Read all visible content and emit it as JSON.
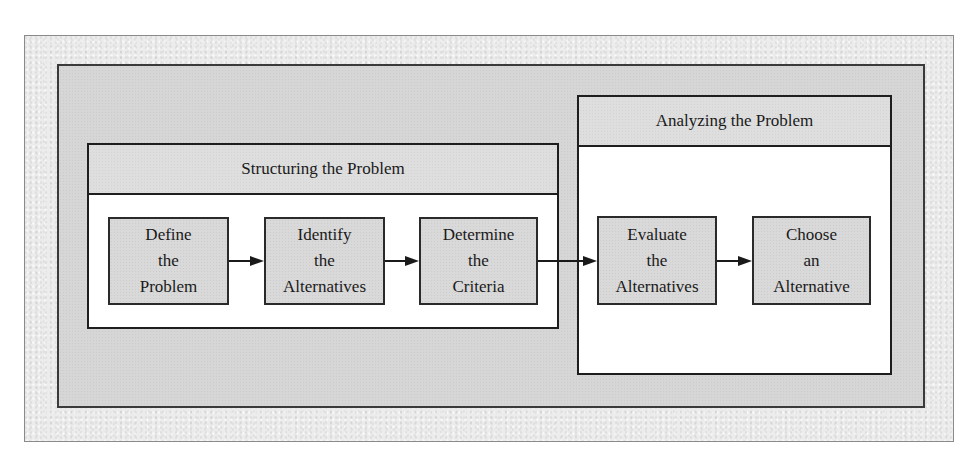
{
  "diagram": {
    "phases": [
      {
        "title": "Structuring the Problem",
        "steps": [
          {
            "lines": [
              "Define",
              "the",
              "Problem"
            ]
          },
          {
            "lines": [
              "Identify",
              "the",
              "Alternatives"
            ]
          },
          {
            "lines": [
              "Determine",
              "the",
              "Criteria"
            ]
          }
        ]
      },
      {
        "title": "Analyzing the Problem",
        "steps": [
          {
            "lines": [
              "Evaluate",
              "the",
              "Alternatives"
            ]
          },
          {
            "lines": [
              "Choose",
              "an",
              "Alternative"
            ]
          }
        ]
      }
    ],
    "flow": [
      "Define the Problem -> Identify the Alternatives",
      "Identify the Alternatives -> Determine the Criteria",
      "Determine the Criteria -> Evaluate the Alternatives",
      "Evaluate the Alternatives -> Choose an Alternative"
    ],
    "colors": {
      "outer_frame": "#ececec",
      "panel": "#d6d6d6",
      "step_fill": "#d9d9d9",
      "border": "#1e1e1e",
      "phase_body": "#ffffff"
    }
  }
}
